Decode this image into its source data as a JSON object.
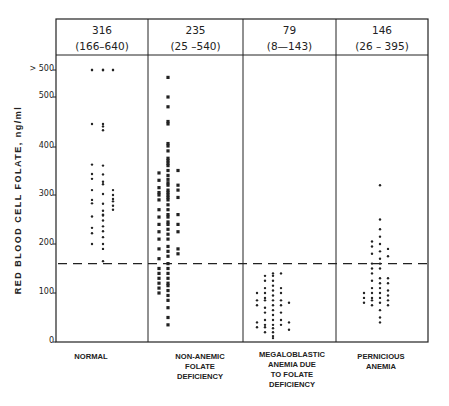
{
  "chart_data": {
    "type": "scatter",
    "title": "",
    "xlabel": "",
    "ylabel": "RED BLOOD CELL FOLATE, ng/ml",
    "ylim": [
      0,
      540
    ],
    "yticks": [
      {
        "label": "0",
        "value": 0
      },
      {
        "label": "100",
        "value": 100
      },
      {
        "label": "200",
        "value": 200
      },
      {
        "label": "300",
        "value": 300
      },
      {
        "label": "400",
        "value": 400
      },
      {
        "label": "500",
        "value": 500
      },
      {
        "label": "> 500",
        "value": 555
      }
    ],
    "reference_line": {
      "style": "dashed",
      "value": 160
    },
    "grid": false,
    "legend": null,
    "categories": [
      "NORMAL",
      "NON-ANEMIC FOLATE DEFICIENCY",
      "MEGALOBLASTIC ANEMIA DUE TO FOLATE DEFICIENCY",
      "PERNICIOUS ANEMIA"
    ],
    "series": [
      {
        "name": "NORMAL",
        "marker": "dot",
        "summary": {
          "mean": "316",
          "range": "(166-640)"
        },
        "columns": [
          [
            555,
            555,
            445,
            362,
            343,
            333,
            310,
            290,
            283,
            256,
            233,
            222,
            200
          ],
          [
            555,
            555,
            550,
            440,
            445,
            432,
            360,
            342,
            327,
            322,
            302,
            282,
            268,
            260,
            258,
            248,
            236,
            226,
            214,
            200,
            190,
            165
          ],
          [
            555,
            555,
            310,
            300,
            292,
            287,
            278,
            270
          ]
        ]
      },
      {
        "name": "NON-ANEMIC FOLATE DEFICIENCY",
        "marker": "square",
        "summary": {
          "mean": "235",
          "range": "(25-540)"
        },
        "columns": [
          [
            345,
            330,
            315,
            305,
            300,
            290,
            270,
            255,
            240,
            225,
            210,
            190,
            170,
            150,
            140,
            130,
            120,
            110,
            100
          ],
          [
            540,
            500,
            480,
            450,
            445,
            405,
            400,
            390,
            375,
            370,
            365,
            360,
            350,
            340,
            332,
            325,
            320,
            310,
            305,
            300,
            295,
            290,
            280,
            270,
            260,
            255,
            245,
            240,
            230,
            220,
            210,
            195,
            185,
            175,
            160,
            150,
            140,
            130,
            120,
            115,
            105,
            95,
            85,
            70,
            50,
            35
          ],
          [
            350,
            320,
            310,
            295,
            260,
            240,
            225,
            190,
            180
          ]
        ]
      },
      {
        "name": "MEGALOBLASTIC ANEMIA DUE TO FOLATE DEFICIENCY",
        "marker": "dot",
        "summary": {
          "mean": "79",
          "range": "(8-143)"
        },
        "columns": [
          [
            100,
            85,
            75,
            40,
            30
          ],
          [
            135,
            125,
            110,
            100,
            90,
            85,
            70,
            60,
            45,
            35,
            30,
            20
          ],
          [
            140,
            135,
            125,
            115,
            105,
            95,
            85,
            75,
            65,
            55,
            45,
            35,
            28,
            20,
            12,
            8
          ],
          [
            140,
            110,
            100,
            85,
            75,
            60,
            45,
            35
          ],
          [
            80,
            40,
            25
          ]
        ]
      },
      {
        "name": "PERNICIOUS ANEMIA",
        "marker": "dot",
        "summary": {
          "mean": "146",
          "range": "(26-395)"
        },
        "columns": [
          [
            100,
            90,
            80
          ],
          [
            205,
            195,
            180,
            160,
            150,
            140,
            125,
            110,
            100,
            90,
            85,
            75
          ],
          [
            320,
            250,
            230,
            215,
            200,
            185,
            170,
            160,
            150,
            130,
            120,
            110,
            100,
            90,
            80,
            65,
            50,
            40
          ],
          [
            190,
            175,
            130,
            120,
            105,
            95,
            85,
            75
          ]
        ]
      }
    ]
  },
  "headers": [
    {
      "mean": "316",
      "range": "(166–640)"
    },
    {
      "mean": "235",
      "range": "(25 –540)"
    },
    {
      "mean": "79",
      "range": "(8—143)"
    },
    {
      "mean": "146",
      "range": "(26 – 395)"
    }
  ],
  "category_labels": [
    "NORMAL",
    "NON-ANEMIC\nFOLATE\nDEFICIENCY",
    "MEGALOBLASTIC\nANEMIA DUE\nTO FOLATE\nDEFICIENCY",
    "PERNICIOUS\nANEMIA"
  ],
  "axis": {
    "ylabel": "RED BLOOD CELL FOLATE,  ng/ml",
    "ticks": [
      "> 500",
      "500",
      "400",
      "300",
      "200",
      "100",
      "0"
    ]
  }
}
